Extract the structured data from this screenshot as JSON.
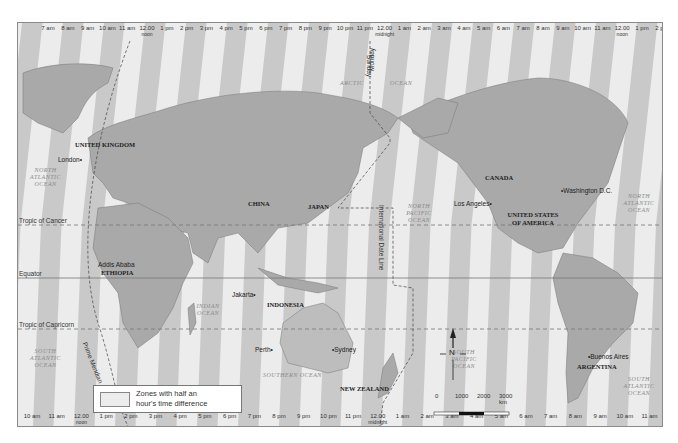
{
  "top_times": [
    {
      "t": "7 am"
    },
    {
      "t": "8 am"
    },
    {
      "t": "9 am"
    },
    {
      "t": "10 am"
    },
    {
      "t": "11 am"
    },
    {
      "t": "12.00",
      "sub": "noon"
    },
    {
      "t": "1 pm"
    },
    {
      "t": "2 pm"
    },
    {
      "t": "3 pm"
    },
    {
      "t": "4 pm"
    },
    {
      "t": "5 pm"
    },
    {
      "t": "6 pm"
    },
    {
      "t": "7 pm"
    },
    {
      "t": "8 pm"
    },
    {
      "t": "9 pm"
    },
    {
      "t": "10 pm"
    },
    {
      "t": "11 pm"
    },
    {
      "t": "12.00",
      "sub": "midnight"
    },
    {
      "t": "1 am"
    },
    {
      "t": "2 am"
    },
    {
      "t": "3 am"
    },
    {
      "t": "4 am"
    },
    {
      "t": "5 am"
    },
    {
      "t": "6 am"
    },
    {
      "t": "7 am"
    },
    {
      "t": "8 am"
    },
    {
      "t": "9 am"
    },
    {
      "t": "10 am"
    },
    {
      "t": "11 am"
    },
    {
      "t": "12.00",
      "sub": "noon"
    },
    {
      "t": "1 pm"
    },
    {
      "t": "2 pm"
    }
  ],
  "bottom_times": [
    {
      "t": "10 am"
    },
    {
      "t": "11 am"
    },
    {
      "t": "12.00",
      "sub": "noon"
    },
    {
      "t": "1 pm"
    },
    {
      "t": "2 pm"
    },
    {
      "t": "3 pm"
    },
    {
      "t": "4 pm"
    },
    {
      "t": "5 pm"
    },
    {
      "t": "6 pm"
    },
    {
      "t": "7 pm"
    },
    {
      "t": "8 pm"
    },
    {
      "t": "9 pm"
    },
    {
      "t": "10 pm"
    },
    {
      "t": "11 pm"
    },
    {
      "t": "12.00",
      "sub": "midnight"
    },
    {
      "t": "1 am"
    },
    {
      "t": "2 am"
    },
    {
      "t": "3 am"
    },
    {
      "t": "4 am"
    },
    {
      "t": "5 am"
    },
    {
      "t": "6 am"
    },
    {
      "t": "7 am"
    },
    {
      "t": "8 am"
    },
    {
      "t": "9 am"
    },
    {
      "t": "10 am"
    },
    {
      "t": "11 am"
    }
  ],
  "countries": {
    "uk": "UNITED KINGDOM",
    "ethiopia": "ETHIOPIA",
    "china": "CHINA",
    "japan": "JAPAN",
    "indonesia": "INDONESIA",
    "new_zealand": "NEW ZEALAND",
    "canada": "CANADA",
    "usa": "UNITED STATES OF AMERICA",
    "argentina": "ARGENTINA"
  },
  "cities": {
    "london": "London",
    "addis_ababa": "Addis Ababa",
    "jakarta": "Jakarta",
    "perth": "Perth",
    "sydney": "Sydney",
    "los_angeles": "Los Angeles",
    "washington": "Washington D.C.",
    "buenos_aires": "Buenos Aires"
  },
  "oceans": {
    "north_atlantic_w": "NORTH ATLANTIC OCEAN",
    "south_atlantic_w": "SOUTH ATLANTIC OCEAN",
    "indian": "INDIAN OCEAN",
    "southern": "SOUTHERN OCEAN",
    "arctic_1": "ARCTIC",
    "arctic_2": "OCEAN",
    "north_pacific": "NORTH PACIFIC OCEAN",
    "south_pacific": "SOUTH PACIFIC OCEAN",
    "north_atlantic_e": "NORTH ATLANTIC OCEAN",
    "south_atlantic_e": "SOUTH ATLANTIC OCEAN"
  },
  "lines": {
    "tropic_cancer": "Tropic of Cancer",
    "equator": "Equator",
    "tropic_capricorn": "Tropic of Capricorn",
    "prime_meridian": "Prime Meridian",
    "date_line": "International Date Line",
    "monday": "Monday",
    "sunday": "Sunday"
  },
  "legend": {
    "line1": "Zones with half an",
    "line2": "hour's time difference"
  },
  "scale": {
    "ticks": [
      "0",
      "1000",
      "2000",
      "3000 km"
    ]
  },
  "compass": {
    "north": "N"
  },
  "colors": {
    "zone_dark": "#c9c9c9",
    "zone_light": "#ececec",
    "land": "#a8a8a8",
    "land_light": "#d6d6d6"
  }
}
